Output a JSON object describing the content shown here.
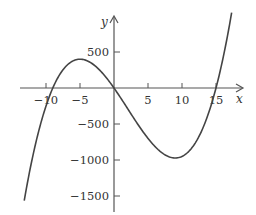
{
  "chart_data": {
    "type": "line",
    "title": "",
    "xlabel": "x",
    "ylabel": "y",
    "function": "y = x^3 - 6x^2 - 135x",
    "xlim": [
      -14,
      19
    ],
    "ylim": [
      -1700,
      900
    ],
    "x_ticks": [
      -10,
      -5,
      5,
      10,
      15
    ],
    "x_tick_labels": [
      "-10",
      "-5",
      "5",
      "10",
      "15"
    ],
    "y_ticks": [
      500,
      -500,
      -1000,
      -1500
    ],
    "y_tick_labels": [
      "500",
      "-500",
      "-1000",
      "-1500"
    ],
    "grid": false,
    "legend": null,
    "series": [
      {
        "name": "cubic",
        "x": [
          -13.2,
          -12,
          -10,
          -9,
          -7,
          -5,
          -3,
          0,
          3,
          5,
          7,
          9,
          11,
          13,
          15,
          16,
          17.3
        ],
        "y": [
          -1563,
          -1296,
          -250,
          0,
          308,
          400,
          324,
          0,
          -432,
          -700,
          -896,
          -972,
          -880,
          -572,
          0,
          400,
          1046
        ]
      }
    ],
    "key_points": {
      "roots": [
        -9,
        0,
        15
      ],
      "local_max": [
        -5,
        400
      ],
      "local_min": [
        9,
        -972
      ]
    }
  },
  "labels": {
    "x_axis": "x",
    "y_axis": "y",
    "x_ticks": [
      "-10",
      "-5",
      "5",
      "10",
      "15"
    ],
    "y_ticks": [
      "500",
      "-500",
      "-1000",
      "-1500"
    ]
  }
}
